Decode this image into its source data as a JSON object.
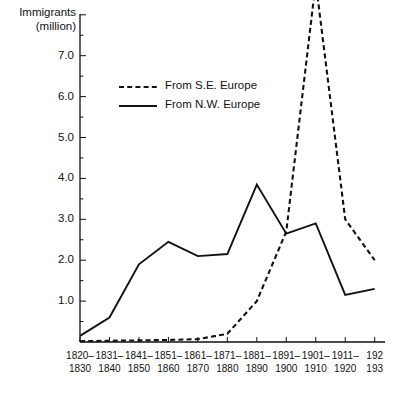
{
  "chart_data": {
    "type": "line",
    "title": "",
    "ylabel": "Immigrants\n(million)",
    "xlabel": "",
    "ylim": [
      0,
      9.0
    ],
    "grid": false,
    "legend_position": "upper-left-inside",
    "categories": [
      "1820–\n1830",
      "1831–\n1840",
      "1841–\n1850",
      "1851–\n1860",
      "1861–\n1870",
      "1871–\n1880",
      "1881–\n1890",
      "1891–\n1900",
      "1901–\n1910",
      "1911–\n1920",
      "192\n193"
    ],
    "ytick_labels": [
      "1.0",
      "2.0",
      "3.0",
      "4.0",
      "5.0",
      "6.0",
      "7.0"
    ],
    "ytick_values": [
      1.0,
      2.0,
      3.0,
      4.0,
      5.0,
      6.0,
      7.0
    ],
    "series": [
      {
        "name": "From S.E. Europe",
        "style": "dashed",
        "color": "#111111",
        "values": [
          0.02,
          0.03,
          0.04,
          0.05,
          0.07,
          0.2,
          1.0,
          2.7,
          8.8,
          3.0,
          2.0
        ]
      },
      {
        "name": "From N.W. Europe",
        "style": "solid",
        "color": "#111111",
        "values": [
          0.15,
          0.6,
          1.9,
          2.45,
          2.1,
          2.15,
          3.85,
          2.65,
          2.9,
          1.15,
          1.3
        ]
      }
    ]
  },
  "legend": {
    "entries": [
      {
        "label": "From S.E. Europe",
        "style": "dashed"
      },
      {
        "label": "From N.W. Europe",
        "style": "solid"
      }
    ]
  }
}
